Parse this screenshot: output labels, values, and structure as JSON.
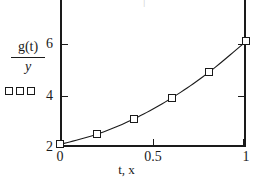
{
  "chart_data": {
    "type": "line",
    "title": "",
    "xlabel": "t, x",
    "ylabel_numerator": "g(t)",
    "ylabel_denominator": "y",
    "x": [
      0,
      0.2,
      0.4,
      0.6,
      0.8,
      1.0
    ],
    "values": [
      2.1,
      2.5,
      3.1,
      3.9,
      4.9,
      6.1
    ],
    "series": [
      {
        "name": "g(t)/y",
        "marker": "open-square",
        "values": [
          2.1,
          2.5,
          3.1,
          3.9,
          4.9,
          6.1
        ]
      }
    ],
    "xlim": [
      0,
      1
    ],
    "ylim": [
      2,
      6.55
    ],
    "xticks": [
      0,
      0.5,
      1
    ],
    "xticklabels": [
      "0",
      "0.5",
      "1"
    ],
    "yticks": [
      4,
      6
    ],
    "yticklabels": [
      "4",
      "6"
    ],
    "y_axis_origin_label": "2",
    "grid": false,
    "legend_position": "left-of-axis",
    "legend_marker_count": 3,
    "line_color": "#1a1a1a",
    "marker_edge_color": "#1a1a1a",
    "marker_face_color": "#ffffff",
    "axis_color": "#1a1a1a",
    "background": "#ffffff"
  },
  "axis": {
    "y_ticks": [
      {
        "label": "6",
        "value": 6
      },
      {
        "label": "4",
        "value": 4
      },
      {
        "label": "2",
        "value": 2
      }
    ],
    "x_ticks": [
      {
        "label": "0",
        "value": 0
      },
      {
        "label": "0.5",
        "value": 0.5
      },
      {
        "label": "1",
        "value": 1
      }
    ],
    "x_title": "t, x"
  },
  "labels": {
    "y_numerator": "g(t)",
    "y_denominator": "y",
    "top_clipped": "|"
  }
}
